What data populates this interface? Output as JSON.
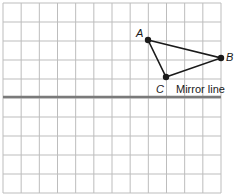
{
  "diagram": {
    "grid": {
      "cols": 12,
      "rows": 10,
      "left": 3,
      "top": 3,
      "right": 221,
      "bottom": 193,
      "color": "#bdbdbd"
    },
    "mirror_line": {
      "label": "Mirror line",
      "y": 97,
      "color": "#7a7a7a"
    },
    "triangle": {
      "points": [
        {
          "name": "A",
          "x": 148,
          "y": 40
        },
        {
          "name": "B",
          "x": 221,
          "y": 58
        },
        {
          "name": "C",
          "x": 166,
          "y": 77
        }
      ],
      "color": "#1a1a1a"
    }
  }
}
